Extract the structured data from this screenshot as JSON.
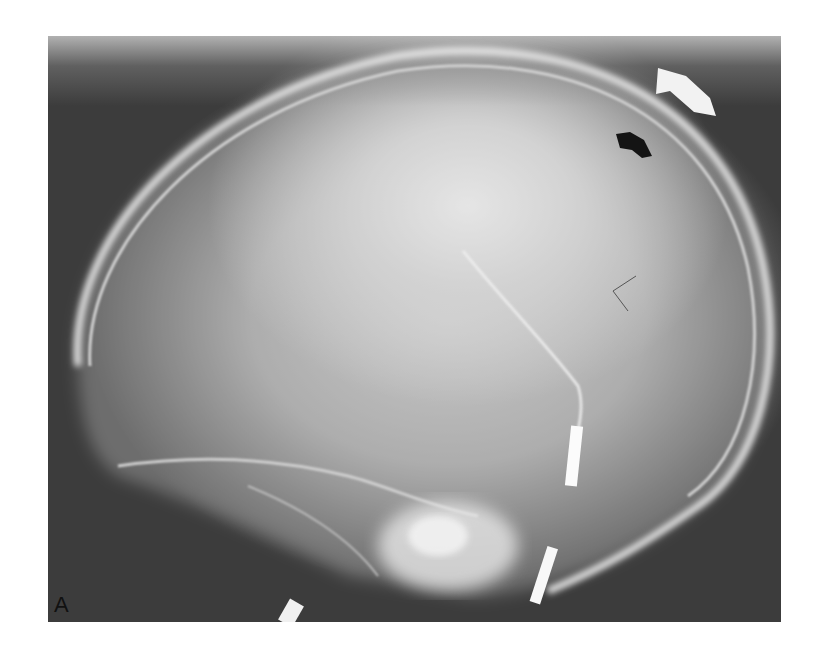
{
  "figure": {
    "panel_label": "A",
    "annotations": [
      {
        "type": "arrow",
        "color": "#ffffff",
        "name": "white-arrow",
        "points_to": "outer skull table, upper right"
      },
      {
        "type": "arrow",
        "color": "#111111",
        "name": "black-arrow",
        "points_to": "inner skull table, upper right"
      }
    ],
    "colors": {
      "background": "#ffffff",
      "film_dark": "#3c3c3c",
      "bone_bright": "#f4f4f4"
    }
  }
}
